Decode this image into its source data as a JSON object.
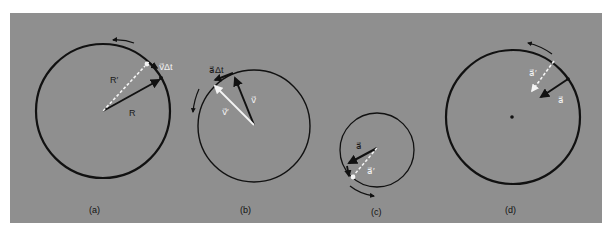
{
  "figure": {
    "background_color": "#8f8f8f",
    "page_color": "#ffffff",
    "ink_color": "#111111",
    "white_vector_color": "#f4f4f4"
  },
  "panels": [
    {
      "id": "a",
      "caption": "(a)",
      "labels": {
        "radius_new": "R′",
        "radius": "R",
        "displacement": "v⃗Δt"
      },
      "description": "Position vector R rotates to R′; difference is v⃗Δt"
    },
    {
      "id": "b",
      "caption": "(b)",
      "labels": {
        "velocity": "v⃗",
        "velocity_new": "v⃗′",
        "change": "a⃗Δt"
      },
      "description": "Velocity vector v⃗ rotates to v⃗′; difference is a⃗Δt"
    },
    {
      "id": "c",
      "caption": "(c)",
      "labels": {
        "accel": "a⃗",
        "accel_new": "a⃗′"
      },
      "description": "Acceleration vector a⃗ rotates to a⃗′"
    },
    {
      "id": "d",
      "caption": "(d)",
      "labels": {
        "accel_new": "a⃗′",
        "accel": "a⃗"
      },
      "description": "Acceleration vectors a⃗ and a⃗′ point toward the center"
    }
  ]
}
